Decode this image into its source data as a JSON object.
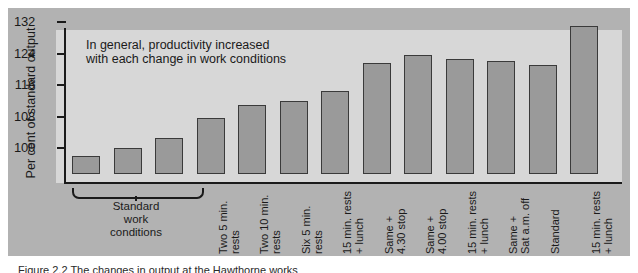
{
  "chart_data": {
    "type": "bar",
    "title": "",
    "xlabel": "",
    "ylabel": "Per cent of standard output",
    "ylim": [
      93,
      133
    ],
    "yticks": [
      100,
      108,
      116,
      124,
      132
    ],
    "grid": false,
    "legend": null,
    "annotation": "In general, productivity increased\nwith each change in work conditions",
    "group_bracket": {
      "label": "Standard\nwork\nconditions",
      "covers_categories": [
        0,
        1,
        2
      ]
    },
    "categories": [
      "",
      "",
      "",
      "Two 5 min.\nrests",
      "Two 10 min.\nrests",
      "Six 5 min.\nrests",
      "15 min. rests\n+ lunch",
      "Same +\n4.30 stop",
      "Same +\n4.00 stop",
      "15 min. rests\n+ lunch",
      "Same +\nSat a.m. off",
      "Standard",
      "15 min. rests\n+ lunch"
    ],
    "values": [
      98,
      100,
      102.5,
      107.5,
      111,
      112,
      114.5,
      121.5,
      123.5,
      122.5,
      122,
      121,
      131
    ]
  },
  "caption": {
    "text": "Figure 2.2  The changes in output at the Hawthorne works"
  },
  "colors": {
    "panel": "#b2b2b2",
    "plot_background": "#d7d7d7",
    "bar_fill": "#9a9a9a",
    "bar_stroke": "#3a3a3a",
    "axis": "#1a1a1a",
    "text": "#1a1a1a"
  }
}
